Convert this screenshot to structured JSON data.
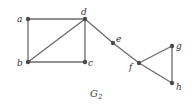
{
  "diagram": {
    "title": "G",
    "title_subscript": "2",
    "nodes": [
      {
        "id": "a",
        "label": "a",
        "x": 28,
        "y": 19
      },
      {
        "id": "b",
        "label": "b",
        "x": 28,
        "y": 62
      },
      {
        "id": "c",
        "label": "c",
        "x": 85,
        "y": 62
      },
      {
        "id": "d",
        "label": "d",
        "x": 85,
        "y": 19
      },
      {
        "id": "e",
        "label": "e",
        "x": 113,
        "y": 43
      },
      {
        "id": "f",
        "label": "f",
        "x": 139,
        "y": 63
      },
      {
        "id": "g",
        "label": "g",
        "x": 172,
        "y": 46
      },
      {
        "id": "h",
        "label": "h",
        "x": 172,
        "y": 83
      }
    ],
    "edges": [
      [
        "a",
        "d"
      ],
      [
        "a",
        "b"
      ],
      [
        "b",
        "c"
      ],
      [
        "b",
        "d"
      ],
      [
        "c",
        "d"
      ],
      [
        "d",
        "e"
      ],
      [
        "e",
        "f"
      ],
      [
        "f",
        "g"
      ],
      [
        "f",
        "h"
      ],
      [
        "g",
        "h"
      ]
    ]
  }
}
